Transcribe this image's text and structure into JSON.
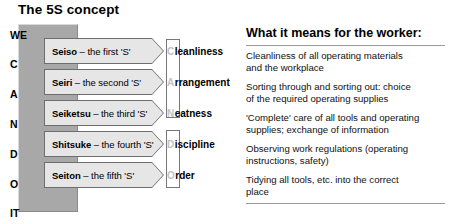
{
  "slide": {
    "title": "The 5S concept"
  },
  "acronym_column": {
    "letters": [
      {
        "text": "WE",
        "top": 6
      },
      {
        "text": "C",
        "top": 35
      },
      {
        "text": "A",
        "top": 65
      },
      {
        "text": "N",
        "top": 95
      },
      {
        "text": "D",
        "top": 125
      },
      {
        "text": "O",
        "top": 155
      },
      {
        "text": "IT",
        "top": 184
      }
    ]
  },
  "s_rows": [
    {
      "top": 38,
      "term": "Seiso",
      "description": "– the first 'S'",
      "meaning_initial": "C",
      "meaning_rest": "leanliness"
    },
    {
      "top": 69,
      "term": "Seiri",
      "description": "– the second 'S'",
      "meaning_initial": "A",
      "meaning_rest": "rrangement"
    },
    {
      "top": 100,
      "term": "Seiketsu",
      "description": "– the third 'S'",
      "meaning_initial": "N",
      "meaning_rest": "eatness"
    },
    {
      "top": 131,
      "term": "Shitsuke",
      "description": "– the fourth 'S'",
      "meaning_initial": "D",
      "meaning_rest": "iscipline"
    },
    {
      "top": 162,
      "term": "Seiton",
      "description": "– the fifth 'S'",
      "meaning_initial": "O",
      "meaning_rest": "rder"
    }
  ],
  "bracket_boxes": [
    {
      "top": 39,
      "height": 79
    },
    {
      "top": 130,
      "height": 58
    }
  ],
  "worker_panel": {
    "heading": "What it means for the worker:",
    "items": [
      {
        "top": 50,
        "line1": "Cleanliness of all operating materials",
        "line2": "and the workplace"
      },
      {
        "top": 81,
        "line1": "Sorting through and sorting out:  choice",
        "line2": "of the required operating supplies"
      },
      {
        "top": 112,
        "line1": "'Complete' care of all tools and operating",
        "line2": "supplies; exchange of information"
      },
      {
        "top": 143,
        "line1": "Observing work regulations (operating",
        "line2": "instructions, safety)"
      },
      {
        "top": 174,
        "line1": "Tidying all tools, etc.  into the correct",
        "line2": "place"
      }
    ]
  },
  "colors": {
    "acronym_column_bg": "#a8a8a8",
    "arrow_fill": "#e6e6e6",
    "arrow_border": "#6e6e6e",
    "faded_initial": "#c2c2c2",
    "rule": "#9a9a9a"
  }
}
